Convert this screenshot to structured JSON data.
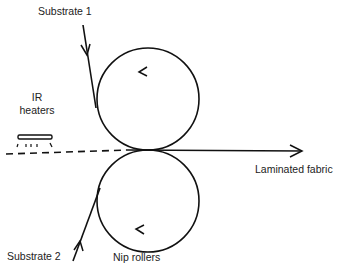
{
  "labels": {
    "substrate1": "Substrate 1",
    "ir_heaters_line1": "IR",
    "ir_heaters_line2": "heaters",
    "laminated_fabric": "Laminated fabric",
    "substrate2": "Substrate 2",
    "nip_rollers": "Nip rollers"
  },
  "colors": {
    "stroke": "#111111",
    "text": "#222222",
    "background": "#ffffff"
  },
  "components": {
    "top_roller": {
      "rotation": "counter-clockwise-arrow-at-top"
    },
    "bottom_roller": {
      "rotation": "arrow-at-bottom"
    },
    "ir_heater": {
      "icon": "heater-bar-with-radiation"
    },
    "flow_arrows": [
      "substrate1-in-arrow",
      "substrate2-in-arrow",
      "laminated-fabric-out-arrow"
    ]
  }
}
